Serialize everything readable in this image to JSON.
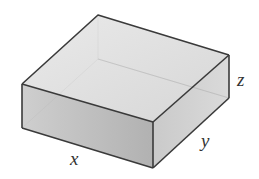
{
  "diagram": {
    "type": "rectangular-box",
    "labels": {
      "length": "x",
      "width": "y",
      "height": "z"
    },
    "colors": {
      "edge": "#3a3a3a",
      "top_face": "#dcdcdc",
      "front_face": "#b8b8b8",
      "side_face": "#c8c8c8",
      "background": "#ffffff"
    }
  }
}
